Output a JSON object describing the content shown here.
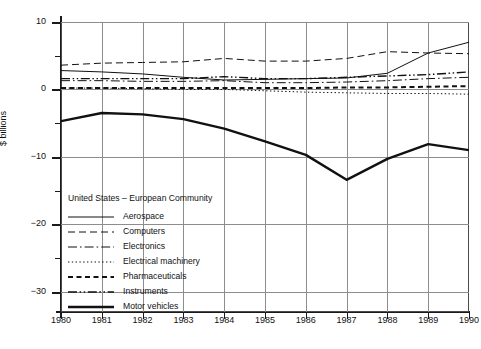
{
  "chart_data": {
    "type": "line",
    "title": "",
    "xlabel": "",
    "ylabel": "$ billions",
    "x": [
      1980,
      1981,
      1982,
      1983,
      1984,
      1985,
      1986,
      1987,
      1988,
      1989,
      1990
    ],
    "xlim": [
      1980,
      1990
    ],
    "ylim": [
      -33,
      10
    ],
    "yticks": [
      10,
      0,
      -10,
      -20,
      -30
    ],
    "ytick_labels": [
      "10",
      "0",
      "−10",
      "−20",
      "−30"
    ],
    "yminor_ticks": [
      5,
      -5,
      -15,
      -25
    ],
    "xtick_labels": [
      "1980",
      "1981",
      "1982",
      "1983",
      "1984",
      "1985",
      "1986",
      "1987",
      "1988",
      "1989",
      "1990"
    ],
    "grid": "both",
    "legend_position": "inside lower-left",
    "legend_title": "United States – European Community",
    "series": [
      {
        "name": "Aerospace",
        "style": "solid",
        "width": 1,
        "values": [
          2.8,
          2.6,
          2.3,
          1.8,
          1.4,
          1.5,
          1.6,
          1.7,
          2.4,
          5.4,
          7.0
        ]
      },
      {
        "name": "Computers",
        "style": "dashed",
        "width": 1,
        "values": [
          3.6,
          3.9,
          4.0,
          4.1,
          4.6,
          4.2,
          4.2,
          4.6,
          5.6,
          5.4,
          5.3
        ]
      },
      {
        "name": "Electronics",
        "style": "dashdot",
        "width": 1,
        "values": [
          1.3,
          1.3,
          1.2,
          1.2,
          1.3,
          1.0,
          1.0,
          1.1,
          1.3,
          1.6,
          1.8
        ]
      },
      {
        "name": "Electrical machinery",
        "style": "dotted",
        "width": 1,
        "values": [
          0.2,
          0.2,
          0.1,
          0.0,
          0.0,
          -0.2,
          -0.4,
          -0.5,
          -0.6,
          -0.6,
          -0.7
        ]
      },
      {
        "name": "Pharmaceuticals",
        "style": "dashed-bold",
        "width": 2,
        "values": [
          0.2,
          0.2,
          0.2,
          0.2,
          0.2,
          0.2,
          0.2,
          0.3,
          0.3,
          0.4,
          0.5
        ]
      },
      {
        "name": "Instruments",
        "style": "dashdotdot",
        "width": 1.4,
        "values": [
          1.6,
          1.6,
          1.6,
          1.6,
          1.9,
          1.6,
          1.6,
          1.8,
          2.0,
          2.2,
          2.6
        ]
      },
      {
        "name": "Motor vehicles",
        "style": "solid-bold",
        "width": 2.4,
        "values": [
          -4.7,
          -3.5,
          -3.7,
          -4.4,
          -5.8,
          -7.7,
          -9.7,
          -13.4,
          -10.3,
          -8.1,
          -9.0
        ]
      }
    ]
  },
  "legend": {
    "title": "United States – European Community",
    "items": [
      {
        "label": "Aerospace"
      },
      {
        "label": "Computers"
      },
      {
        "label": "Electronics"
      },
      {
        "label": "Electrical machinery"
      },
      {
        "label": "Pharmaceuticals"
      },
      {
        "label": "Instruments"
      },
      {
        "label": "Motor vehicles"
      }
    ]
  },
  "axes": {
    "y_title": "$ billions"
  }
}
